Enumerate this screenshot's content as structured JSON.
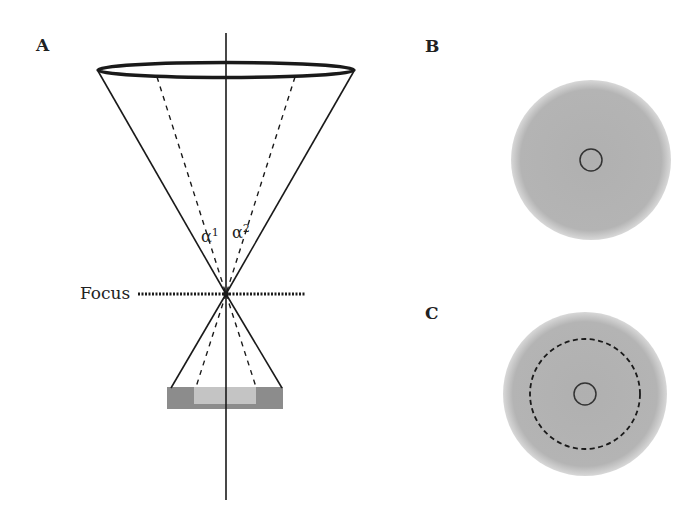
{
  "panels": {
    "a": {
      "label": "A",
      "focus_label": "Focus",
      "alpha1": "α",
      "alpha1_sup": "1",
      "alpha2": "α",
      "alpha2_sup": "2"
    },
    "b": {
      "label": "B"
    },
    "c": {
      "label": "C"
    }
  },
  "colors": {
    "line": "#1a1a1a",
    "disk": "#b3b3b3",
    "detector_outer": "#8c8c8c",
    "detector_inner": "#c4c4c4"
  }
}
